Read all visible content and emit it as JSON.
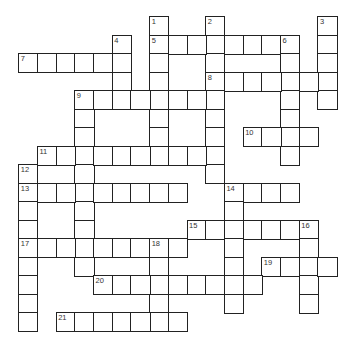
{
  "puzzle": {
    "origin": {
      "x": 19,
      "y": 17
    },
    "cell_w": 18.7,
    "cell_h": 18.5,
    "entries": [
      {
        "number": "1",
        "direction": "down",
        "col": 7,
        "row": 0,
        "length": 8
      },
      {
        "number": "2",
        "direction": "down",
        "col": 10,
        "row": 0,
        "length": 9
      },
      {
        "number": "3",
        "direction": "down",
        "col": 16,
        "row": 0,
        "length": 5
      },
      {
        "number": "4",
        "direction": "down",
        "col": 5,
        "row": 1,
        "length": 4
      },
      {
        "number": "5",
        "direction": "across",
        "col": 7,
        "row": 1,
        "length": 8
      },
      {
        "number": "6",
        "direction": "down",
        "col": 14,
        "row": 1,
        "length": 7
      },
      {
        "number": "7",
        "direction": "across",
        "col": 0,
        "row": 2,
        "length": 6
      },
      {
        "number": "8",
        "direction": "across",
        "col": 10,
        "row": 3,
        "length": 7
      },
      {
        "number": "9",
        "direction": "across",
        "col": 3,
        "row": 4,
        "length": 8
      },
      {
        "number": "9",
        "direction": "down",
        "col": 3,
        "row": 4,
        "length": 10
      },
      {
        "number": "10",
        "direction": "across",
        "col": 12,
        "row": 6,
        "length": 4
      },
      {
        "number": "11",
        "direction": "across",
        "col": 1,
        "row": 7,
        "length": 10
      },
      {
        "number": "12",
        "direction": "down",
        "col": 0,
        "row": 8,
        "length": 9
      },
      {
        "number": "13",
        "direction": "across",
        "col": 0,
        "row": 9,
        "length": 9
      },
      {
        "number": "14",
        "direction": "across",
        "col": 11,
        "row": 9,
        "length": 4
      },
      {
        "number": "14",
        "direction": "down",
        "col": 11,
        "row": 9,
        "length": 7
      },
      {
        "number": "15",
        "direction": "across",
        "col": 9,
        "row": 11,
        "length": 7
      },
      {
        "number": "16",
        "direction": "down",
        "col": 15,
        "row": 11,
        "length": 5
      },
      {
        "number": "17",
        "direction": "across",
        "col": 0,
        "row": 12,
        "length": 9
      },
      {
        "number": "18",
        "direction": "down",
        "col": 7,
        "row": 12,
        "length": 5
      },
      {
        "number": "19",
        "direction": "across",
        "col": 13,
        "row": 13,
        "length": 4
      },
      {
        "number": "20",
        "direction": "across",
        "col": 4,
        "row": 14,
        "length": 9
      },
      {
        "number": "21",
        "direction": "across",
        "col": 2,
        "row": 16,
        "length": 7
      }
    ],
    "numbers": [
      {
        "n": "1",
        "col": 7,
        "row": 0
      },
      {
        "n": "2",
        "col": 10,
        "row": 0
      },
      {
        "n": "3",
        "col": 16,
        "row": 0
      },
      {
        "n": "4",
        "col": 5,
        "row": 1
      },
      {
        "n": "5",
        "col": 7,
        "row": 1
      },
      {
        "n": "6",
        "col": 14,
        "row": 1
      },
      {
        "n": "7",
        "col": 0,
        "row": 2
      },
      {
        "n": "8",
        "col": 10,
        "row": 3
      },
      {
        "n": "9",
        "col": 3,
        "row": 4
      },
      {
        "n": "10",
        "col": 12,
        "row": 6
      },
      {
        "n": "11",
        "col": 1,
        "row": 7
      },
      {
        "n": "12",
        "col": 0,
        "row": 8
      },
      {
        "n": "13",
        "col": 0,
        "row": 9
      },
      {
        "n": "14",
        "col": 11,
        "row": 9
      },
      {
        "n": "15",
        "col": 9,
        "row": 11
      },
      {
        "n": "16",
        "col": 15,
        "row": 11
      },
      {
        "n": "17",
        "col": 0,
        "row": 12
      },
      {
        "n": "18",
        "col": 7,
        "row": 12
      },
      {
        "n": "19",
        "col": 13,
        "row": 13
      },
      {
        "n": "20",
        "col": 4,
        "row": 14
      },
      {
        "n": "21",
        "col": 2,
        "row": 16
      }
    ]
  }
}
